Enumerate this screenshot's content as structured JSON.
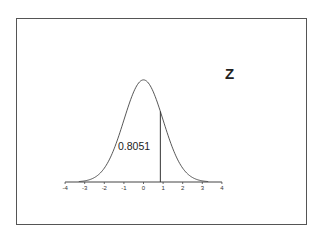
{
  "chart_data": {
    "type": "area",
    "title": "",
    "subtitle": "",
    "distribution": "standard normal",
    "xlabel": "",
    "ylabel": "",
    "x_ticks": [
      -4,
      -3,
      -2,
      -1,
      0,
      1,
      2,
      3,
      4
    ],
    "xlim": [
      -4,
      4
    ],
    "grid": false,
    "legend": null,
    "z_value": 0.86,
    "shaded_area_label": "0.8051",
    "annotations": [
      {
        "text": "Z",
        "position": "upper-right"
      },
      {
        "text": "0.8051",
        "position": "left of cutoff, inside curve"
      }
    ],
    "curve": {
      "x": [
        -4,
        -3.5,
        -3,
        -2.5,
        -2,
        -1.5,
        -1,
        -0.5,
        0,
        0.5,
        1,
        1.5,
        2,
        2.5,
        3,
        3.5,
        4
      ],
      "y": [
        0.0001,
        0.0009,
        0.0044,
        0.0175,
        0.054,
        0.1295,
        0.242,
        0.3521,
        0.3989,
        0.3521,
        0.242,
        0.1295,
        0.054,
        0.0175,
        0.0044,
        0.0009,
        0.0001
      ]
    }
  },
  "labels": {
    "z": "Z",
    "area": "0.8051",
    "ticks": [
      "-4",
      "-3",
      "-2",
      "-1",
      "0",
      "1",
      "2",
      "3",
      "4"
    ]
  },
  "colors": {
    "frame": "#555555",
    "curve": "#444444",
    "text": "#222222"
  }
}
